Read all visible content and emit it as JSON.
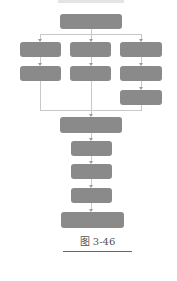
{
  "diagram": {
    "type": "flowchart",
    "top_text": "",
    "box_color": "#8a8a8a",
    "line_color": "#c8c8c8",
    "nodes": [
      {
        "id": "top",
        "label": ""
      },
      {
        "id": "branch-1-step-1",
        "label": ""
      },
      {
        "id": "branch-2-step-1",
        "label": ""
      },
      {
        "id": "branch-3-step-1",
        "label": ""
      },
      {
        "id": "branch-1-step-2",
        "label": ""
      },
      {
        "id": "branch-2-step-2",
        "label": ""
      },
      {
        "id": "branch-3-step-2",
        "label": ""
      },
      {
        "id": "branch-3-step-3",
        "label": ""
      },
      {
        "id": "merge",
        "label": ""
      },
      {
        "id": "step-a",
        "label": ""
      },
      {
        "id": "step-b",
        "label": ""
      },
      {
        "id": "step-c",
        "label": ""
      },
      {
        "id": "final",
        "label": ""
      }
    ],
    "edges": [
      [
        "top",
        "branch-1-step-1"
      ],
      [
        "top",
        "branch-2-step-1"
      ],
      [
        "top",
        "branch-3-step-1"
      ],
      [
        "branch-1-step-1",
        "branch-1-step-2"
      ],
      [
        "branch-2-step-1",
        "branch-2-step-2"
      ],
      [
        "branch-3-step-1",
        "branch-3-step-2"
      ],
      [
        "branch-3-step-2",
        "branch-3-step-3"
      ],
      [
        "branch-1-step-2",
        "merge"
      ],
      [
        "branch-2-step-2",
        "merge"
      ],
      [
        "branch-3-step-3",
        "merge"
      ],
      [
        "merge",
        "step-a"
      ],
      [
        "step-a",
        "step-b"
      ],
      [
        "step-b",
        "step-c"
      ],
      [
        "step-c",
        "final"
      ]
    ]
  },
  "caption": "图 3-46"
}
